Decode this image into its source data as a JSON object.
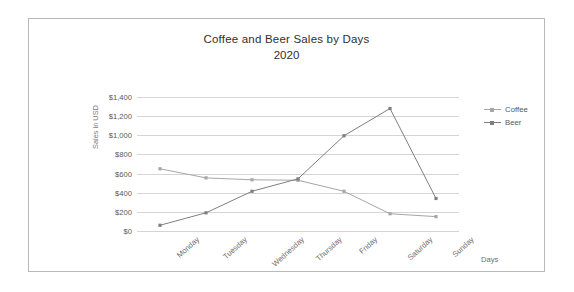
{
  "chart_data": {
    "type": "line",
    "title": "Coffee and Beer Sales by Days",
    "subtitle": "2020",
    "xlabel": "Days",
    "ylabel": "Sales in USD",
    "categories": [
      "Monday",
      "Tuesday",
      "Wednesday",
      "Thursday",
      "Friday",
      "Saturday",
      "Sunday"
    ],
    "series": [
      {
        "name": "Coffee",
        "color": "#a6a6a6",
        "values": [
          650,
          555,
          535,
          530,
          415,
          180,
          150
        ]
      },
      {
        "name": "Beer",
        "color": "#7f7f7f",
        "values": [
          60,
          190,
          415,
          545,
          995,
          1280,
          340
        ]
      }
    ],
    "ylim": [
      0,
      1400
    ],
    "ytick_step": 200,
    "ytick_labels": [
      "$0",
      "$200",
      "$400",
      "$600",
      "$800",
      "$1,000",
      "$1,200",
      "$1,400"
    ],
    "ytick_values": [
      0,
      200,
      400,
      600,
      800,
      1000,
      1200,
      1400
    ],
    "grid": true,
    "legend_position": "right",
    "marker": "square"
  },
  "legend": {
    "entries": [
      {
        "label": "Coffee"
      },
      {
        "label": "Beer"
      }
    ]
  }
}
